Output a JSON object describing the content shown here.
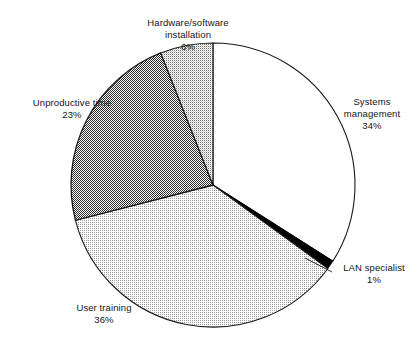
{
  "chart_data": {
    "type": "pie",
    "title": "",
    "subtitle": "",
    "xlabel": "",
    "ylabel": "",
    "legend_position": "none",
    "grid": false,
    "start_angle_deg": 0,
    "direction": "clockwise",
    "units": "percent",
    "categories": [
      "Systems management",
      "LAN specialist",
      "User training",
      "Unproductive time",
      "Hardware/software installation"
    ],
    "values": [
      34,
      1,
      36,
      23,
      6
    ],
    "slices": [
      {
        "id": "systems",
        "label": "Systems",
        "label_line2": "management",
        "name": "Systems management",
        "value": 34,
        "value_text": "34%",
        "fill": "#ffffff",
        "pattern": "solid-white",
        "start_deg": 0,
        "end_deg": 122.4
      },
      {
        "id": "lan",
        "label": "LAN specialist",
        "label_line2": "",
        "name": "LAN specialist",
        "value": 1,
        "value_text": "1%",
        "fill": "#000000",
        "pattern": "solid-black",
        "start_deg": 122.4,
        "end_deg": 126.0
      },
      {
        "id": "training",
        "label": "User training",
        "label_line2": "",
        "name": "User training",
        "value": 36,
        "value_text": "36%",
        "fill": "#d9d9d9",
        "pattern": "dither-light",
        "start_deg": 126.0,
        "end_deg": 255.6
      },
      {
        "id": "unproductive",
        "label": "Unproductive time",
        "label_line2": "",
        "name": "Unproductive time",
        "value": 23,
        "value_text": "23%",
        "fill": "#8a8a8a",
        "pattern": "dither-dark-checker",
        "start_deg": 255.6,
        "end_deg": 338.4
      },
      {
        "id": "hardware",
        "label": "Hardware/software",
        "label_line2": "installation",
        "name": "Hardware/software installation",
        "value": 6,
        "value_text": "6%",
        "fill": "#c4c4c4",
        "pattern": "dither-medium",
        "start_deg": 338.4,
        "end_deg": 360.0
      }
    ],
    "colors": {
      "outline": "#1a1a1a",
      "text": "#151515",
      "background": "#ffffff",
      "leader_line": "#1a1a1a"
    },
    "geometry": {
      "center_x": 213,
      "center_y": 185,
      "radius": 142
    }
  }
}
